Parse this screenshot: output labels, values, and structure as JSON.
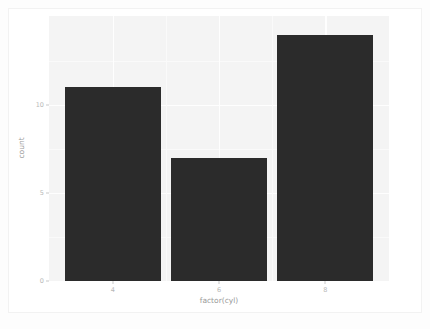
{
  "chart_data": {
    "type": "bar",
    "title": "",
    "subtitle": "",
    "xlabel": "factor(cyl)",
    "ylabel": "count",
    "categories": [
      "4",
      "6",
      "8"
    ],
    "values": [
      11,
      7,
      14
    ],
    "series": [
      {
        "name": "count",
        "values": [
          11,
          7,
          14
        ]
      }
    ],
    "x_tick_labels": [
      "4",
      "6",
      "8"
    ],
    "y_tick_labels": [
      "0",
      "5",
      "10"
    ],
    "y_tick_values": [
      0,
      5,
      10
    ],
    "ylim": [
      0,
      15.05
    ],
    "xlim": [
      0.4,
      3.6
    ],
    "grid": true,
    "legend": "none",
    "bar_color": "#2b2b2b",
    "panel_background": "#f4f4f4",
    "gridline_color": "#fefefe",
    "axis_text_color": "#b8b8b8",
    "axis_title_color": "#9a9a9a"
  },
  "figure": {
    "bars": [
      {
        "name": "bar-cyl-4",
        "category": "4",
        "value": 11
      },
      {
        "name": "bar-cyl-6",
        "category": "6",
        "value": 7
      },
      {
        "name": "bar-cyl-8",
        "category": "8",
        "value": 14
      }
    ]
  }
}
